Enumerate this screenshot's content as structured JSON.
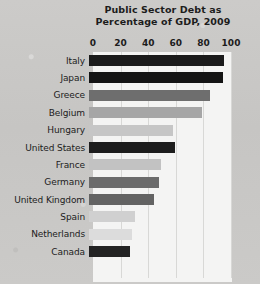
{
  "chart_data": {
    "type": "bar",
    "orientation": "horizontal",
    "title": "Public Sector Debt as Percentage of GDP, 2009",
    "title_line1": "Public Sector Debt as",
    "title_line2": "Percentage of GDP, 2009",
    "xlabel": "",
    "ylabel": "",
    "xlim": [
      0,
      100
    ],
    "xticks": [
      0,
      20,
      40,
      60,
      80,
      100
    ],
    "xtick_labels": [
      "0",
      "20",
      "40",
      "60",
      "80",
      "100"
    ],
    "grid": true,
    "grid_axis": "x",
    "legend": false,
    "categories": [
      "Italy",
      "Japan",
      "Greece",
      "Belgium",
      "Hungary",
      "United States",
      "France",
      "Germany",
      "United Kingdom",
      "Spain",
      "Netherlands",
      "Canada"
    ],
    "values": [
      98,
      97,
      88,
      82,
      61,
      62,
      52,
      51,
      47,
      33,
      31,
      30
    ],
    "bar_colors": [
      "#1b1b1b",
      "#141414",
      "#6e6e6e",
      "#a6a6a6",
      "#c6c6c6",
      "#1d1d1d",
      "#c2c2c2",
      "#6b6b6b",
      "#636363",
      "#d0d0d0",
      "#dcdcdc",
      "#232323"
    ],
    "plot_background": "#f4f4f3",
    "page_background": "#c9c9c7",
    "grid_color": "#d8d8d6",
    "text_color": "#1c1c1c"
  }
}
